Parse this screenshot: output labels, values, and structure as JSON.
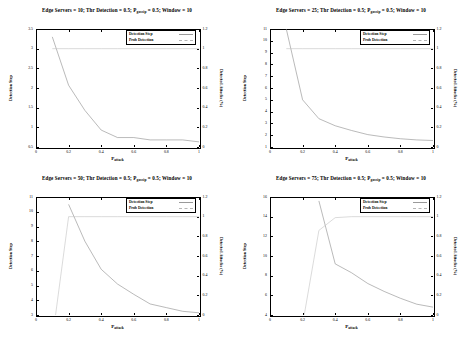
{
  "figure": {
    "background": "#ffffff",
    "line_color_detection_step": "#8c8c8c",
    "line_color_prob_detection": "#c2c2c2",
    "panel_count": 4
  },
  "common": {
    "xlabel_main": "P",
    "xlabel_sub": "attack",
    "ylabel_left": "Detection Step",
    "ylabel_right": "Detected Attacks (%)",
    "legend": [
      "Detection Step",
      "Prob Detection"
    ],
    "xticks": [
      "0",
      "0.2",
      "0.4",
      "0.6",
      "0.8",
      "1"
    ],
    "right_ticks": [
      "0",
      "0.2",
      "0.4",
      "0.6",
      "0.8",
      "1",
      "1.2"
    ]
  },
  "chart_data": [
    {
      "id": "panel-edge-servers-10",
      "type": "line",
      "title_parts": {
        "a": "Edge Servers = 10; Thr Detection = 0.5; P",
        "sub": "gossip",
        "b": " = 0.5; Window = 10"
      },
      "title": "Edge Servers = 10; Thr Detection = 0.5; P_gossip = 0.5; Window = 10",
      "xlabel": "P_attack",
      "ylabel": "Detection Step",
      "y2label": "Detected Attacks (%)",
      "xlim": [
        0,
        1
      ],
      "ylim": [
        0.5,
        3.5
      ],
      "y2lim": [
        0,
        1.2
      ],
      "yticks": [
        "0.5",
        "1",
        "1.5",
        "2",
        "2.5",
        "3",
        "3.5"
      ],
      "ytick_values": [
        0.5,
        1,
        1.5,
        2,
        2.5,
        3,
        3.5
      ],
      "y2ticks": [
        "0",
        "0.2",
        "0.4",
        "0.6",
        "0.8",
        "1",
        "1.2"
      ],
      "xticks": [
        "0",
        "0.2",
        "0.4",
        "0.6",
        "0.8",
        "1"
      ],
      "grid": false,
      "legend_position": "top-right",
      "series": [
        {
          "name": "Detection Step",
          "axis": "left",
          "x": [
            0.1,
            0.2,
            0.3,
            0.4,
            0.5,
            0.6,
            0.7,
            0.8,
            0.9,
            1.0
          ],
          "values": [
            3.3,
            2.07,
            1.43,
            0.93,
            0.74,
            0.74,
            0.68,
            0.68,
            0.68,
            0.63
          ]
        },
        {
          "name": "Prob Detection",
          "axis": "right",
          "x": [
            0.1,
            0.2,
            0.3,
            0.4,
            0.5,
            0.6,
            0.7,
            0.8,
            0.9,
            1.0
          ],
          "values": [
            1.0,
            1.0,
            1.0,
            1.0,
            1.0,
            1.0,
            1.0,
            1.0,
            1.0,
            1.0
          ]
        }
      ]
    },
    {
      "id": "panel-edge-servers-25",
      "type": "line",
      "title_parts": {
        "a": "Edge Servers = 25; Thr Detection = 0.5; P",
        "sub": "gossip",
        "b": " = 0.5; Window = 10"
      },
      "title": "Edge Servers = 25; Thr Detection = 0.5; P_gossip = 0.5; Window = 10",
      "xlabel": "P_attack",
      "ylabel": "Detection Step",
      "y2label": "Detected Attacks (%)",
      "xlim": [
        0,
        1
      ],
      "ylim": [
        1,
        11
      ],
      "y2lim": [
        0,
        1.2
      ],
      "yticks": [
        "1",
        "2",
        "3",
        "4",
        "5",
        "6",
        "7",
        "8",
        "9",
        "10",
        "11"
      ],
      "ytick_values": [
        1,
        2,
        3,
        4,
        5,
        6,
        7,
        8,
        9,
        10,
        11
      ],
      "y2ticks": [
        "0",
        "0.2",
        "0.4",
        "0.6",
        "0.8",
        "1",
        "1.2"
      ],
      "xticks": [
        "0",
        "0.2",
        "0.4",
        "0.6",
        "0.8",
        "1"
      ],
      "grid": false,
      "legend_position": "top-right",
      "series": [
        {
          "name": "Detection Step",
          "axis": "left",
          "x": [
            0.1,
            0.2,
            0.3,
            0.4,
            0.5,
            0.6,
            0.7,
            0.8,
            0.9,
            1.0
          ],
          "values": [
            11.0,
            5.0,
            3.4,
            2.8,
            2.4,
            2.05,
            1.85,
            1.7,
            1.6,
            1.55
          ]
        },
        {
          "name": "Prob Detection",
          "axis": "right",
          "x": [
            0.1,
            0.2,
            0.3,
            0.4,
            0.5,
            0.6,
            0.7,
            0.8,
            0.9,
            1.0
          ],
          "values": [
            1.0,
            1.0,
            1.0,
            1.0,
            1.0,
            1.0,
            1.0,
            1.0,
            1.0,
            1.0
          ]
        }
      ]
    },
    {
      "id": "panel-edge-servers-50",
      "type": "line",
      "title_parts": {
        "a": "Edge Servers = 50; Thr Detection = 0.5; P",
        "sub": "gossip",
        "b": " = 0.5; Window = 10"
      },
      "title": "Edge Servers = 50; Thr Detection = 0.5; P_gossip = 0.5; Window = 10",
      "xlabel": "P_attack",
      "ylabel": "Detection Step",
      "y2label": "Detected Attacks (%)",
      "xlim": [
        0,
        1
      ],
      "ylim": [
        3,
        11
      ],
      "y2lim": [
        0,
        1.2
      ],
      "yticks": [
        "3",
        "4",
        "5",
        "6",
        "7",
        "8",
        "9",
        "10",
        "11"
      ],
      "ytick_values": [
        3,
        4,
        5,
        6,
        7,
        8,
        9,
        10,
        11
      ],
      "y2ticks": [
        "0",
        "0.2",
        "0.4",
        "0.6",
        "0.8",
        "1",
        "1.2"
      ],
      "xticks": [
        "0",
        "0.2",
        "0.4",
        "0.6",
        "0.8",
        "1"
      ],
      "grid": false,
      "legend_position": "top-right",
      "series": [
        {
          "name": "Detection Step",
          "axis": "left",
          "x": [
            0.2,
            0.3,
            0.4,
            0.5,
            0.6,
            0.7,
            0.8,
            0.9,
            1.0
          ],
          "values": [
            10.5,
            8.0,
            6.1,
            5.1,
            4.4,
            3.75,
            3.5,
            3.25,
            3.15
          ]
        },
        {
          "name": "Prob Detection",
          "axis": "right",
          "x": [
            0.12,
            0.2,
            0.3,
            0.4,
            0.5,
            0.6,
            0.7,
            0.8,
            0.9,
            1.0
          ],
          "values": [
            0.0,
            1.0,
            1.0,
            1.0,
            1.0,
            1.0,
            1.0,
            1.0,
            1.0,
            1.0
          ]
        }
      ]
    },
    {
      "id": "panel-edge-servers-75",
      "type": "line",
      "title_parts": {
        "a": "Edge Servers = 75; Thr Detection = 0.5; P",
        "sub": "gossip",
        "b": " = 0.5; Window = 10"
      },
      "title": "Edge Servers = 75; Thr Detection = 0.5; P_gossip = 0.5; Window = 10",
      "xlabel": "P_attack",
      "ylabel": "Detection Step",
      "y2label": "Detected Attacks (%)",
      "xlim": [
        0,
        1
      ],
      "ylim": [
        4,
        16
      ],
      "y2lim": [
        0,
        1.2
      ],
      "yticks": [
        "4",
        "6",
        "8",
        "10",
        "12",
        "14",
        "16"
      ],
      "ytick_values": [
        4,
        6,
        8,
        10,
        12,
        14,
        16
      ],
      "y2ticks": [
        "0",
        "0.2",
        "0.4",
        "0.6",
        "0.8",
        "1",
        "1.2"
      ],
      "xticks": [
        "0",
        "0.2",
        "0.4",
        "0.6",
        "0.8",
        "1"
      ],
      "grid": false,
      "legend_position": "top-right",
      "series": [
        {
          "name": "Detection Step",
          "axis": "left",
          "x": [
            0.3,
            0.4,
            0.5,
            0.6,
            0.7,
            0.8,
            0.9,
            1.0
          ],
          "values": [
            15.6,
            9.2,
            8.3,
            7.2,
            6.4,
            5.7,
            5.1,
            4.8
          ]
        },
        {
          "name": "Prob Detection",
          "axis": "right",
          "x": [
            0.21,
            0.3,
            0.4,
            0.5,
            0.6,
            0.7,
            0.8,
            0.9,
            1.0
          ],
          "values": [
            0.0,
            0.86,
            0.99,
            1.0,
            1.0,
            1.0,
            1.0,
            1.0,
            1.0
          ]
        }
      ]
    }
  ]
}
